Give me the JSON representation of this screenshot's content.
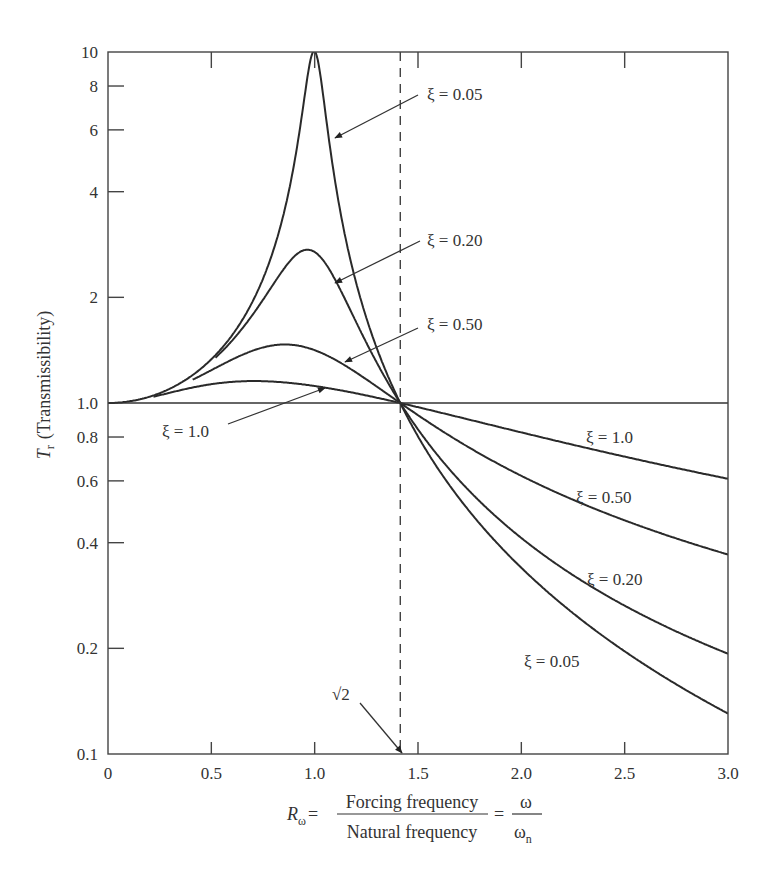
{
  "chart_data": {
    "type": "line",
    "title": "",
    "xlabel": {
      "lhs": "R",
      "lhs_sub": "ω",
      "numerator": "Forcing frequency",
      "denominator": "Natural frequency",
      "rhs_numerator": "ω",
      "rhs_denominator": "ω",
      "rhs_denominator_sub": "n"
    },
    "ylabel": {
      "symbol": "T",
      "symbol_sub": "r",
      "text": "(Transmissibility)"
    },
    "xlim": [
      0,
      3.0
    ],
    "ylim": [
      0.1,
      10
    ],
    "yscale": "log",
    "grid": false,
    "xticks": [
      {
        "value": 0,
        "label": "0"
      },
      {
        "value": 0.5,
        "label": "0.5"
      },
      {
        "value": 1.0,
        "label": "1.0"
      },
      {
        "value": 1.5,
        "label": "1.5"
      },
      {
        "value": 2.0,
        "label": "2.0"
      },
      {
        "value": 2.5,
        "label": "2.5"
      },
      {
        "value": 3.0,
        "label": "3.0"
      }
    ],
    "yticks": [
      {
        "value": 0.1,
        "label": "0.1"
      },
      {
        "value": 0.2,
        "label": "0.2"
      },
      {
        "value": 0.4,
        "label": "0.4"
      },
      {
        "value": 0.6,
        "label": "0.6"
      },
      {
        "value": 0.8,
        "label": "0.8"
      },
      {
        "value": 1.0,
        "label": "1.0"
      },
      {
        "value": 2,
        "label": "2"
      },
      {
        "value": 4,
        "label": "4"
      },
      {
        "value": 6,
        "label": "6"
      },
      {
        "value": 8,
        "label": "8"
      },
      {
        "value": 10,
        "label": "10"
      }
    ],
    "formula": "T = sqrt((1 + (2ξr)^2) / ((1 - r^2)^2 + (2ξr)^2))",
    "series": [
      {
        "name": "ξ = 0.05",
        "zeta": 0.05,
        "x_start": 0.0,
        "x_end": 3.0,
        "points": [
          [
            0,
            1.0
          ],
          [
            0.5,
            1.33
          ],
          [
            0.8,
            2.77
          ],
          [
            0.9,
            5.2
          ],
          [
            1.2,
            2.26
          ],
          [
            1.414,
            1.0
          ],
          [
            2.0,
            0.34
          ],
          [
            2.5,
            0.2
          ],
          [
            3.0,
            0.13
          ]
        ]
      },
      {
        "name": "ξ = 0.20",
        "zeta": 0.2,
        "x_start": 0.52,
        "x_end": 3.0,
        "points": [
          [
            0.52,
            1.38
          ],
          [
            0.8,
            2.28
          ],
          [
            0.95,
            2.68
          ],
          [
            1.2,
            1.73
          ],
          [
            1.414,
            1.0
          ],
          [
            2.0,
            0.42
          ],
          [
            2.5,
            0.27
          ],
          [
            3.0,
            0.2
          ]
        ]
      },
      {
        "name": "ξ = 0.50",
        "zeta": 0.5,
        "x_start": 0.41,
        "x_end": 3.0,
        "points": [
          [
            0.41,
            1.16
          ],
          [
            0.8,
            1.42
          ],
          [
            1.0,
            1.41
          ],
          [
            1.2,
            1.23
          ],
          [
            1.414,
            1.0
          ],
          [
            2.0,
            0.63
          ],
          [
            2.5,
            0.47
          ],
          [
            3.0,
            0.38
          ]
        ]
      },
      {
        "name": "ξ = 1.0",
        "zeta": 1.0,
        "x_start": 0.22,
        "x_end": 3.0,
        "points": [
          [
            0.22,
            1.02
          ],
          [
            0.6,
            1.09
          ],
          [
            0.85,
            1.11
          ],
          [
            1.2,
            1.06
          ],
          [
            1.414,
            1.0
          ],
          [
            2.0,
            0.82
          ],
          [
            2.5,
            0.69
          ],
          [
            3.0,
            0.6
          ]
        ]
      }
    ],
    "reference_lines": [
      {
        "type": "horizontal",
        "y": 1.0,
        "style": "solid"
      },
      {
        "type": "vertical",
        "x": 1.4142,
        "style": "dashed",
        "label": "√2"
      }
    ],
    "annotations": [
      {
        "text": "ξ = 0.05",
        "series": "ξ = 0.05",
        "arrow": true,
        "arrow_target": [
          1.07,
          5.9
        ],
        "position": "top-center"
      },
      {
        "text": "ξ = 0.20",
        "series": "ξ = 0.20",
        "arrow": true,
        "arrow_target": [
          1.09,
          2.1
        ],
        "position": "upper-center"
      },
      {
        "text": "ξ = 0.50",
        "series": "ξ = 0.50",
        "arrow": true,
        "arrow_target": [
          1.15,
          1.27
        ],
        "position": "center"
      },
      {
        "text": "ξ = 1.0",
        "series": "ξ = 1.0",
        "arrow": true,
        "arrow_target": [
          1.05,
          1.08
        ],
        "position": "left-center"
      },
      {
        "text": "ξ = 1.0",
        "series": "ξ = 1.0",
        "arrow": false,
        "position": "right"
      },
      {
        "text": "ξ = 0.50",
        "series": "ξ = 0.50",
        "arrow": false,
        "position": "right"
      },
      {
        "text": "ξ = 0.20",
        "series": "ξ = 0.20",
        "arrow": false,
        "position": "right"
      },
      {
        "text": "ξ = 0.05",
        "series": "ξ = 0.05",
        "arrow": false,
        "position": "lower-right"
      },
      {
        "text": "√2",
        "arrow": true,
        "arrow_target": [
          1.4142,
          0.1
        ],
        "position": "bottom-center"
      }
    ]
  }
}
